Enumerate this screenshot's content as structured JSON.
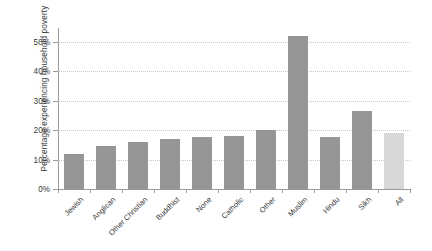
{
  "chart_data": {
    "type": "bar",
    "title": "",
    "subtitle": "",
    "xlabel": "",
    "ylabel": "Percentage experiencing household poverty",
    "categories": [
      "Jewish",
      "Anglican",
      "Other Christian",
      "Buddhist",
      "None",
      "Catholic",
      "Other",
      "Muslim",
      "Hindu",
      "Sikh",
      "All"
    ],
    "values": [
      12,
      14.5,
      16,
      17,
      17.5,
      18,
      20,
      52,
      17.5,
      26.5,
      19
    ],
    "ytick_labels": [
      "0%",
      "10%",
      "20%",
      "30%",
      "40%",
      "50%"
    ],
    "ytick_values": [
      0,
      10,
      20,
      30,
      40,
      50
    ],
    "ylim": [
      0,
      55
    ],
    "grid": true,
    "legend": "none",
    "bar_color": "#969696",
    "highlight_bar_color": "#d8d8d8",
    "highlight_category": "All",
    "gridline_color": "#c9c9c9",
    "axis_color": "#9a9a9a",
    "background_color": "#ffffff"
  }
}
